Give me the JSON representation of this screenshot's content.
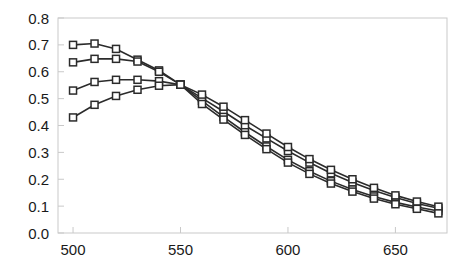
{
  "chart_data": {
    "type": "line",
    "title": "",
    "xlabel": "",
    "ylabel": "",
    "xlim": [
      493,
      674
    ],
    "ylim": [
      0.0,
      0.8
    ],
    "grid": false,
    "legend": "none",
    "marker": "open-square",
    "line_color": "#2b2b2b",
    "marker_fill": "#ffffff",
    "xticks": [
      500,
      550,
      600,
      650
    ],
    "xtick_labels": [
      "500",
      "550",
      "600",
      "650"
    ],
    "yticks": [
      0.0,
      0.1,
      0.2,
      0.3,
      0.4,
      0.5,
      0.6,
      0.7,
      0.8
    ],
    "ytick_labels": [
      "0.0",
      "0.1",
      "0.2",
      "0.3",
      "0.4",
      "0.5",
      "0.6",
      "0.7",
      "0.8"
    ],
    "x": [
      500,
      510,
      520,
      530,
      540,
      550,
      560,
      570,
      580,
      590,
      600,
      610,
      620,
      630,
      640,
      650,
      660,
      670
    ],
    "series": [
      {
        "name": "series-1",
        "values": [
          0.7,
          0.705,
          0.685,
          0.645,
          0.605,
          0.552,
          0.502,
          0.452,
          0.4,
          0.352,
          0.305,
          0.262,
          0.222,
          0.188,
          0.158,
          0.132,
          0.11,
          0.092
        ]
      },
      {
        "name": "series-2",
        "values": [
          0.635,
          0.648,
          0.648,
          0.638,
          0.6,
          0.552,
          0.492,
          0.432,
          0.375,
          0.322,
          0.272,
          0.23,
          0.193,
          0.162,
          0.136,
          0.114,
          0.097,
          0.082
        ]
      },
      {
        "name": "series-3",
        "values": [
          0.53,
          0.562,
          0.57,
          0.57,
          0.565,
          0.552,
          0.515,
          0.47,
          0.42,
          0.37,
          0.32,
          0.275,
          0.235,
          0.2,
          0.168,
          0.14,
          0.117,
          0.098
        ]
      },
      {
        "name": "series-4",
        "values": [
          0.43,
          0.477,
          0.51,
          0.533,
          0.548,
          0.552,
          0.48,
          0.422,
          0.365,
          0.312,
          0.262,
          0.22,
          0.184,
          0.154,
          0.128,
          0.107,
          0.09,
          0.073
        ]
      }
    ]
  }
}
